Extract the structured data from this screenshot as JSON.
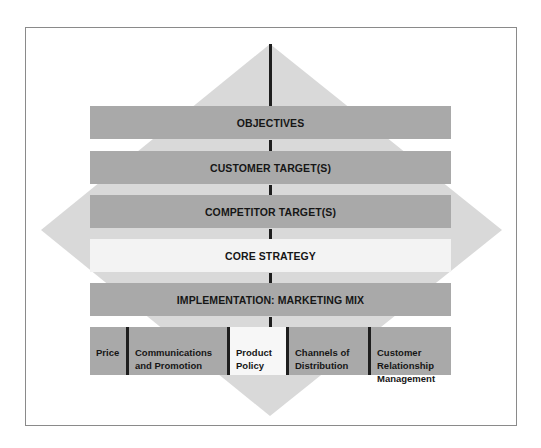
{
  "diagram": {
    "title": "",
    "layers": [
      {
        "label": "OBJECTIVES",
        "style": "dark"
      },
      {
        "label": "CUSTOMER TARGET(S)",
        "style": "dark"
      },
      {
        "label": "COMPETITOR TARGET(S)",
        "style": "dark"
      },
      {
        "label": "CORE STRATEGY",
        "style": "light"
      },
      {
        "label": "IMPLEMENTATION: MARKETING MIX",
        "style": "dark"
      }
    ],
    "marketing_mix": [
      {
        "label": "Price",
        "style": "dark"
      },
      {
        "label": "Communications\nand Promotion",
        "style": "dark"
      },
      {
        "label": "Product\nPolicy",
        "style": "light"
      },
      {
        "label": "Channels of\nDistribution",
        "style": "dark"
      },
      {
        "label": "Customer\nRelationship\nManagement",
        "style": "dark"
      }
    ],
    "colors": {
      "band": "#a9a9a9",
      "band_highlight": "#f3f3f3",
      "diamond": "#d9d9d9",
      "spine": "#1e1e1e",
      "frame": "#8a8a8a"
    }
  }
}
